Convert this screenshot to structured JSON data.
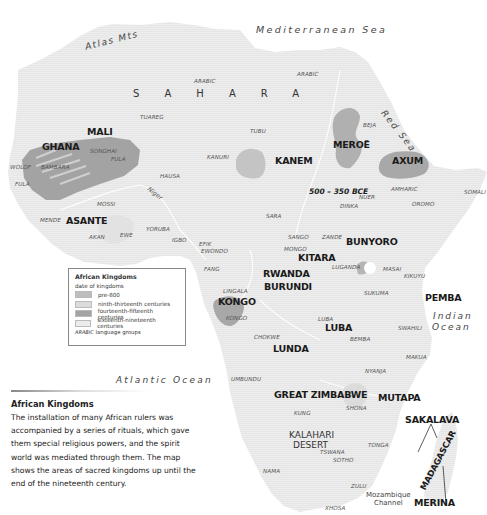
{
  "map": {
    "seas": {
      "mediterranean": "Mediterranean Sea",
      "red": "Red Sea",
      "atlantic": "Atlantic Ocean",
      "indian_line1": "Indian",
      "indian_line2": "Ocean",
      "mozambique_line1": "Mozambique",
      "mozambique_line2": "Channel"
    },
    "physical": {
      "atlas": "Atlas Mts",
      "sahara": "SAHARA",
      "kalahari_line1": "KALAHARI",
      "kalahari_line2": "DESERT",
      "niger": "Niger"
    },
    "date_annotation": "500 – 350 BCE",
    "kingdoms": {
      "mali": "MALI",
      "ghana": "GHANA",
      "kanem": "KANEM",
      "meroe": "MEROË",
      "axum": "AXUM",
      "asante": "ASANTE",
      "bunyoro": "BUNYORO",
      "kitara": "KITARA",
      "rwanda": "RWANDA",
      "burundi": "BURUNDI",
      "kongo": "KONGO",
      "pemba": "PEMBA",
      "luba": "LUBA",
      "lunda": "LUNDA",
      "great_zimbabwe": "GREAT ZIMBABWE",
      "mutapa": "MUTAPA",
      "sakalava": "SAKALAVA",
      "madagascar": "MADAGASCAR",
      "merina": "MERINA"
    },
    "languages": {
      "arabic_w": "ARABIC",
      "arabic_e": "ARABIC",
      "tuareg": "TUAREG",
      "tubu": "TUBU",
      "beja": "BEJA",
      "songhai": "SONGHAI",
      "fula_n": "FULA",
      "fula_w": "FULA",
      "wolof": "WOLOF",
      "bambara": "BAMBARA",
      "kanuri": "KANURI",
      "hausa": "HAUSA",
      "mossi": "MOSSI",
      "mende": "MENDE",
      "akan": "AKAN",
      "ewe": "EWE",
      "yoruba": "YORUBA",
      "igbo": "IGBO",
      "efik": "EFIK",
      "ewondo": "EWONDO",
      "fang": "FANG",
      "amharic": "AMHARIC",
      "somali": "SOMALI",
      "oromo": "OROMO",
      "nuer": "NUER",
      "dinka": "DINKA",
      "sara": "SARA",
      "sango": "SANGO",
      "zande": "ZANDE",
      "mongo": "MONGO",
      "luganda": "LUGANDA",
      "masai": "MASAI",
      "kikuyu": "KIKUYU",
      "sukuma": "SUKUMA",
      "lingala": "LINGALA",
      "kongo_lang": "KONGO",
      "luba_lang": "LUBA",
      "chokwe": "CHOKWE",
      "bemba": "BEMBA",
      "swahili": "SWAHILI",
      "makua": "MAKUA",
      "nyanja": "NYANJA",
      "umbundu": "UMBUNDU",
      "shona": "SHONA",
      "kung": "KUNG",
      "tonga": "TONGA",
      "tswana": "TSWANA",
      "sotho": "SOTHO",
      "nama": "NAMA",
      "zulu": "ZULU",
      "xhosa": "XHOSA"
    }
  },
  "legend": {
    "title": "African Kingdoms",
    "subtitle": "date of kingdoms",
    "items": [
      {
        "label": "pre-800",
        "color": "#bdbdbd"
      },
      {
        "label": "ninth-thirteenth centuries",
        "color": "#dcdcdc"
      },
      {
        "label": "fourteenth-fifteenth centuries",
        "color": "#a3a3a3"
      },
      {
        "label": "sixteenth-nineteenth centuries",
        "color": "#ececec"
      }
    ],
    "lang_sample": "ARABIC",
    "lang_label": "language groups"
  },
  "caption": {
    "title": "African Kingdoms",
    "body": "The installation of many African rulers was accompanied by a series of rituals, which gave them special religious powers, and the spirit world was mediated through them. The map shows the areas of sacred kingdoms up until the end of the nineteenth century."
  },
  "colors": {
    "land": "#ececec",
    "pre800": "#bdbdbd",
    "c9_13": "#dcdcdc",
    "c14_15": "#a3a3a3",
    "c16_19": "#e6e6e6",
    "river": "#ffffff"
  }
}
